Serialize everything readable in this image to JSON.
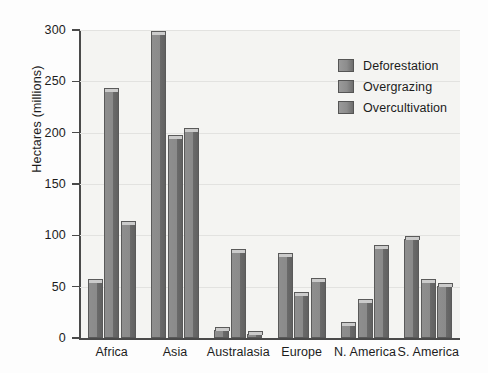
{
  "chart_data": {
    "type": "bar",
    "title": "",
    "xlabel": "",
    "ylabel": "Hectares (millions)",
    "categories": [
      "Africa",
      "Asia",
      "Australasia",
      "Europe",
      "N. America",
      "S. America"
    ],
    "series": [
      {
        "name": "Deforestation",
        "values": [
          55,
          296,
          8,
          80,
          13,
          96
        ]
      },
      {
        "name": "Overgrazing",
        "values": [
          241,
          195,
          84,
          42,
          35,
          55
        ]
      },
      {
        "name": "Overcultivation",
        "values": [
          111,
          202,
          4,
          56,
          88,
          51
        ]
      }
    ],
    "ylim": [
      0,
      300
    ],
    "yticks": [
      0,
      50,
      100,
      150,
      200,
      250,
      300
    ],
    "ytick_labels": [
      "0",
      "50",
      "100",
      "150",
      "200",
      "250",
      "300"
    ],
    "grid": true,
    "legend_position": "upper-right",
    "colors": {
      "bar_face": "#8a8a8a",
      "bar_side": "#616161",
      "bar_top": "#cbcbcb",
      "bar_edge": "#5a5a5a",
      "plot_background": "#f4f4f2",
      "gridline": "#e2e2e0",
      "axis": "#4a4a4a",
      "text": "#1c1c1c"
    }
  }
}
